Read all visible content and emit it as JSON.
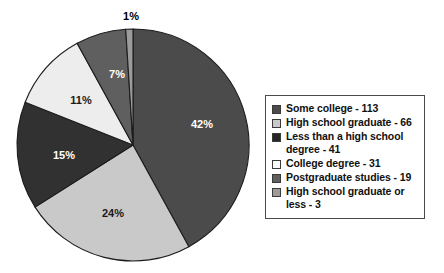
{
  "chart_data": {
    "type": "pie",
    "title": "",
    "subtitle": "",
    "xlabel": "",
    "ylabel": "",
    "grid": false,
    "legend_position": "right",
    "total": 273,
    "start_angle_deg": 0,
    "direction": "clockwise",
    "categories": [
      "Some college",
      "High school graduate",
      "Less than a high school degree",
      "College degree",
      "Postgraduate studies",
      "High school graduate or less"
    ],
    "values": [
      113,
      66,
      41,
      31,
      19,
      3
    ],
    "percent_labels": [
      "42%",
      "24%",
      "15%",
      "11%",
      "7%",
      "1%"
    ],
    "percents": [
      42,
      24,
      15,
      11,
      7,
      1
    ],
    "colors": [
      "#4b4b4b",
      "#c9c9c9",
      "#313131",
      "#ededed",
      "#5f5f5f",
      "#9b9b9b"
    ],
    "slices": [
      {
        "label": "Some college",
        "value": 113,
        "percent": 42,
        "percent_label": "42%",
        "color": "#4b4b4b",
        "label_fill": "on-dark",
        "label_x": 202,
        "label_y": 125
      },
      {
        "label": "High school graduate",
        "value": 66,
        "percent": 24,
        "percent_label": "24%",
        "color": "#c9c9c9",
        "label_fill": "on-light",
        "label_x": 113,
        "label_y": 214
      },
      {
        "label": "Less than a high school degree",
        "value": 41,
        "percent": 15,
        "percent_label": "15%",
        "color": "#313131",
        "label_fill": "on-dark",
        "label_x": 64,
        "label_y": 156
      },
      {
        "label": "College degree",
        "value": 31,
        "percent": 11,
        "percent_label": "11%",
        "color": "#ededed",
        "label_fill": "on-light",
        "label_x": 81,
        "label_y": 101
      },
      {
        "label": "Postgraduate studies",
        "value": 19,
        "percent": 7,
        "percent_label": "7%",
        "color": "#5f5f5f",
        "label_fill": "on-dark",
        "label_x": 117,
        "label_y": 75
      },
      {
        "label": "High school graduate or less",
        "value": 3,
        "percent": 1,
        "percent_label": "1%",
        "color": "#9b9b9b",
        "label_fill": "outside",
        "label_x": 131,
        "label_y": 17
      }
    ]
  },
  "legend": {
    "items": [
      {
        "text": "Some college - 113",
        "color": "#4b4b4b"
      },
      {
        "text": "High school graduate - 66",
        "color": "#c9c9c9"
      },
      {
        "text": "Less than a high school degree - 41",
        "color": "#262626"
      },
      {
        "text": "College degree - 31",
        "color": "#fbfbfb"
      },
      {
        "text": "Postgraduate studies - 19",
        "color": "#5f5f5f"
      },
      {
        "text": "High school graduate or less - 3",
        "color": "#9b9b9b"
      }
    ]
  }
}
